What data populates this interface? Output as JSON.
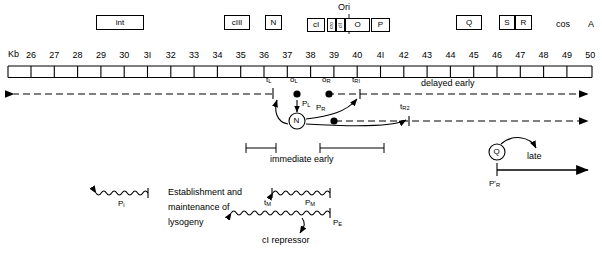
{
  "figure": {
    "type": "genetic-map-diagram",
    "axis_unit_label": "Kb"
  },
  "ruler": {
    "unit": "Kb",
    "tick_labels": [
      "26",
      "27",
      "28",
      "29",
      "30",
      "3I",
      "32",
      "33",
      "34",
      "35",
      "36",
      "37",
      "38",
      "39",
      "40",
      "4I",
      "42",
      "43",
      "44",
      "45",
      "46",
      "47",
      "48",
      "49",
      "50"
    ],
    "start_kb": 26,
    "end_kb": 50
  },
  "gene_boxes": [
    {
      "name": "int",
      "label": "int",
      "orientation": "horizontal"
    },
    {
      "name": "cIII",
      "label": "cIII",
      "orientation": "horizontal"
    },
    {
      "name": "N",
      "label": "N",
      "orientation": "horizontal"
    },
    {
      "name": "cI",
      "label": "cI",
      "orientation": "horizontal"
    },
    {
      "name": "cro",
      "label": "cro",
      "orientation": "vertical"
    },
    {
      "name": "cII",
      "label": "cII",
      "orientation": "vertical"
    },
    {
      "name": "O",
      "label": "O",
      "orientation": "horizontal"
    },
    {
      "name": "P",
      "label": "P",
      "orientation": "horizontal"
    },
    {
      "name": "Q",
      "label": "Q",
      "orientation": "horizontal"
    },
    {
      "name": "S",
      "label": "S",
      "orientation": "horizontal"
    },
    {
      "name": "R",
      "label": "R",
      "orientation": "horizontal"
    }
  ],
  "top_annotations": {
    "ori": "Ori",
    "cos": "cos",
    "A": "A"
  },
  "sites": {
    "tL": "t<sub>L</sub>",
    "oL": "o<sub>L</sub>",
    "pL": "P<sub>L</sub>",
    "oR": "o<sub>R</sub>",
    "tR1": "t<sub>RI</sub>",
    "pR": "P<sub>R</sub>",
    "tR2": "t<sub>R2</sub>",
    "N_protein": "N",
    "Q_protein": "Q",
    "pRprime": "P'<sub>R</sub>",
    "pI": "P<sub>i</sub>",
    "tM": "t<sub>M</sub>",
    "pM": "P<sub>M</sub>",
    "pE": "P<sub>E</sub>"
  },
  "transcript_labels": {
    "delayed_early": "delayed early",
    "immediate_early": "immediate  early",
    "late": "late",
    "cI_repressor": "cI repressor"
  },
  "lysogeny_text": {
    "line1": "Establishment and",
    "line2": "maintenance of",
    "line3": "lysogeny"
  },
  "colors": {
    "ink": "#000000",
    "background": "#ffffff"
  }
}
